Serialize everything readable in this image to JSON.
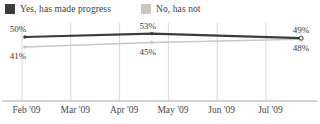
{
  "colors": {
    "series_yes": "#3c3c3c",
    "series_no": "#c9c7c0",
    "gridline": "#d9d9d9",
    "axis_line": "#a8a8a8",
    "data_label_text": "#3b3b3b",
    "tick_label_text": "#474747",
    "background": "#ffffff"
  },
  "legend": {
    "items": [
      {
        "label": "Yes, has made progress",
        "color": "#3c3c3c"
      },
      {
        "label": "No, has not",
        "color": "#c9c7c0"
      }
    ]
  },
  "chart_data": {
    "type": "line",
    "title": "",
    "grid": "vertical",
    "legend_position": "top",
    "x_axis": {
      "tick_labels": [
        "Feb '09",
        "Mar '09",
        "Apr '09",
        "May '09",
        "Jun '09",
        "Jul '09"
      ]
    },
    "series": [
      {
        "name": "Yes, has made progress",
        "color": "#3c3c3c",
        "stroke_width": 2.2,
        "points": [
          {
            "x_month": 0.06,
            "value": 50,
            "label": "50%"
          },
          {
            "x_month": 2.66,
            "value": 53,
            "label": "53%"
          },
          {
            "x_month": 5.72,
            "value": 49,
            "label": "49%"
          }
        ]
      },
      {
        "name": "No, has not",
        "color": "#c9c7c0",
        "stroke_width": 1.5,
        "points": [
          {
            "x_month": 0.06,
            "value": 41,
            "label": "41%"
          },
          {
            "x_month": 2.66,
            "value": 45,
            "label": "45%"
          },
          {
            "x_month": 5.72,
            "value": 48,
            "label": "48%"
          }
        ]
      }
    ]
  }
}
